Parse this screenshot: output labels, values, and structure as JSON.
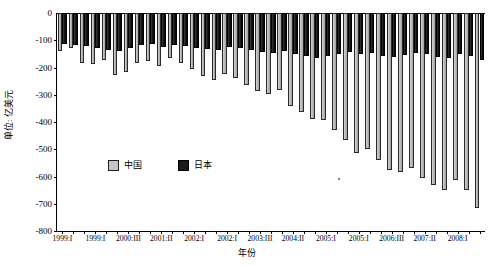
{
  "chart_data": {
    "type": "bar",
    "title": "",
    "xlabel": "年份",
    "ylabel": "单位: 亿美元",
    "ylim": [
      -800,
      0
    ],
    "yticks": [
      0,
      -100,
      -200,
      -300,
      -400,
      -500,
      -600,
      -700,
      -800
    ],
    "ytick_labels": [
      "0",
      "-100",
      "-200",
      "-300",
      "-400",
      "-500",
      "-600",
      "-700",
      "-800"
    ],
    "grid": false,
    "legend_position": "inside-lower-left",
    "orientation": "vertical",
    "categories": [
      "1999:I",
      "1999:II",
      "1999:III",
      "1999:IV",
      "2000:I",
      "2000:II",
      "2000:III",
      "2000:IV",
      "2001:I",
      "2001:II",
      "2001:III",
      "2001:IV",
      "2002:I",
      "2002:II",
      "2002:III",
      "2002:IV",
      "2003:I",
      "2003:II",
      "2003:III",
      "2003:IV",
      "2004:I",
      "2004:II",
      "2004:III",
      "2004:IV",
      "2005:I",
      "2005:II",
      "2005:III",
      "2005:IV",
      "2006:I",
      "2006:II",
      "2006:III",
      "2006:IV",
      "2007:I",
      "2007:II",
      "2007:III",
      "2007:IV",
      "2008:I",
      "2008:II",
      "2008:III"
    ],
    "xtick_labels": [
      "1999:I",
      "1999:I",
      "2000:III",
      "2001:II",
      "2002:I",
      "2002:I",
      "2003:III",
      "2004:II",
      "2005:I",
      "2005:I",
      "2006:III",
      "2007:II",
      "2008:I"
    ],
    "xtick_category_index": [
      0,
      3,
      6,
      9,
      12,
      15,
      18,
      21,
      24,
      27,
      30,
      33,
      36
    ],
    "series": [
      {
        "name": "中国",
        "color": "#b7b7b7",
        "values": [
          -138,
          -128,
          -182,
          -188,
          -171,
          -228,
          -216,
          -185,
          -176,
          -196,
          -166,
          -183,
          -205,
          -230,
          -247,
          -225,
          -238,
          -263,
          -288,
          -296,
          -282,
          -340,
          -364,
          -388,
          -392,
          -430,
          -466,
          -512,
          -498,
          -540,
          -576,
          -584,
          -570,
          -604,
          -632,
          -648,
          -612,
          -648,
          -716
        ]
      },
      {
        "name": "日本",
        "color": "#1b1b1b",
        "values": [
          -112,
          -118,
          -122,
          -128,
          -134,
          -139,
          -129,
          -118,
          -112,
          -126,
          -118,
          -122,
          -128,
          -131,
          -134,
          -126,
          -129,
          -135,
          -144,
          -148,
          -140,
          -152,
          -158,
          -166,
          -158,
          -150,
          -142,
          -152,
          -148,
          -156,
          -160,
          -155,
          -148,
          -152,
          -160,
          -164,
          -152,
          -158,
          -172
        ]
      }
    ]
  }
}
